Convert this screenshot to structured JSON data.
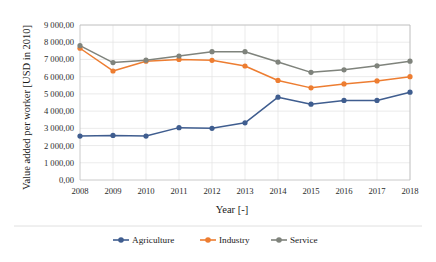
{
  "chart_data": {
    "type": "line",
    "title": "",
    "xlabel": "Year [-]",
    "ylabel": "Value added per worker [USD in 2010]",
    "categories": [
      "2008",
      "2009",
      "2010",
      "2011",
      "2012",
      "2013",
      "2014",
      "2015",
      "2016",
      "2017",
      "2018"
    ],
    "x_tick_labels": [
      "2008",
      "2009",
      "2010",
      "2011",
      "2012",
      "2013",
      "2014",
      "2015",
      "2016",
      "2017",
      "2018"
    ],
    "y_tick_labels": [
      "0,00",
      "1 000,00",
      "2 000,00",
      "3 000,00",
      "4 000,00",
      "5 000,00",
      "6 000,00",
      "7 000,00",
      "8 000,00",
      "9 000,00"
    ],
    "y_tick_values": [
      0,
      1000,
      2000,
      3000,
      4000,
      5000,
      6000,
      7000,
      8000,
      9000
    ],
    "ylim": [
      0,
      9000
    ],
    "grid": true,
    "legend_position": "bottom",
    "series": [
      {
        "name": "Agriculture",
        "color": "#3f5d8f",
        "values": [
          2550,
          2590,
          2550,
          3040,
          3000,
          3320,
          4810,
          4400,
          4620,
          4620,
          5100
        ]
      },
      {
        "name": "Industry",
        "color": "#ed7d31",
        "values": [
          7650,
          6330,
          6900,
          7000,
          6950,
          6620,
          5780,
          5350,
          5580,
          5750,
          6000
        ]
      },
      {
        "name": "Service",
        "color": "#7f837c",
        "values": [
          7800,
          6820,
          6960,
          7200,
          7450,
          7450,
          6850,
          6250,
          6400,
          6630,
          6900
        ]
      }
    ]
  },
  "legend": {
    "items": [
      {
        "label": "Agriculture",
        "color": "#3f5d8f"
      },
      {
        "label": "Industry",
        "color": "#ed7d31"
      },
      {
        "label": "Service",
        "color": "#7f837c"
      }
    ]
  }
}
